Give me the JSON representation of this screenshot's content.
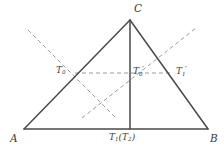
{
  "figure": {
    "kind": "geometry-diagram",
    "width": 224,
    "height": 157,
    "colors": {
      "background": "#ffffff",
      "solid_line": "#4a4a4a",
      "dashed_line": "#9a9a9a",
      "label_text": "#3a3a3a"
    },
    "vertices": [
      {
        "name": "A",
        "label": "A",
        "x": 24,
        "y": 129,
        "label_x": 10,
        "label_y": 133
      },
      {
        "name": "B",
        "label": "B",
        "x": 208,
        "y": 129,
        "label_x": 210,
        "label_y": 133
      },
      {
        "name": "C",
        "label": "C",
        "x": 130,
        "y": 20,
        "label_x": 134,
        "label_y": 3
      }
    ],
    "points": [
      {
        "name": "T0",
        "base": "T",
        "subscript": "0",
        "prime": "",
        "x": 75,
        "y": 73,
        "label_x": 56,
        "label_y": 66
      },
      {
        "name": "T0-prime",
        "base": "T",
        "subscript": "0",
        "prime": "′",
        "x": 130,
        "y": 73,
        "label_x": 133,
        "label_y": 66
      },
      {
        "name": "T1-prime",
        "base": "T",
        "subscript": "1",
        "prime": "′",
        "x": 172,
        "y": 73,
        "label_x": 176,
        "label_y": 66
      },
      {
        "name": "T1-T2",
        "base": "T",
        "subscript": "1",
        "prime": "",
        "paren_open": "(",
        "paren_base": "T",
        "paren_subscript": "2",
        "paren_close": ")",
        "x": 130,
        "y": 129,
        "label_x": 109,
        "label_y": 133
      }
    ],
    "solid_segments": [
      {
        "name": "side-AB",
        "x1": 24,
        "y1": 129,
        "x2": 208,
        "y2": 129
      },
      {
        "name": "side-AC",
        "x1": 24,
        "y1": 129,
        "x2": 130,
        "y2": 20
      },
      {
        "name": "side-BC",
        "x1": 208,
        "y1": 129,
        "x2": 130,
        "y2": 20
      },
      {
        "name": "altitude-C-T1",
        "x1": 130,
        "y1": 20,
        "x2": 130,
        "y2": 129
      }
    ],
    "dashed_segments": [
      {
        "name": "dashed-upper-left-descending",
        "x1": 28,
        "y1": 30,
        "x2": 116,
        "y2": 118
      },
      {
        "name": "dashed-lower-left-ascending",
        "x1": 82,
        "y1": 118,
        "x2": 196,
        "y2": 28
      },
      {
        "name": "dashed-horizontal-T0-to-right",
        "x1": 75,
        "y1": 73,
        "x2": 171,
        "y2": 73
      }
    ]
  }
}
